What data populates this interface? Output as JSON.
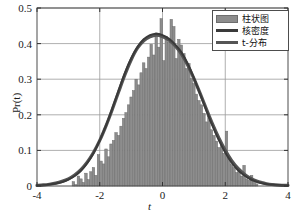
{
  "chart_data": {
    "type": "bar",
    "title": "",
    "xlabel": "t",
    "ylabel": "Pr(t)",
    "xlim": [
      -4,
      4
    ],
    "ylim": [
      0,
      0.5
    ],
    "grid": true,
    "xticks": [
      "-4",
      "-2",
      "0",
      "2",
      "4"
    ],
    "xtick_values": [
      -4,
      -2,
      0,
      2,
      4
    ],
    "yticks": [
      "0",
      "0.1",
      "0.2",
      "0.3",
      "0.4",
      "0.5"
    ],
    "ytick_values": [
      0,
      0.1,
      0.2,
      0.3,
      0.4,
      0.5
    ],
    "legend_position": "top-right",
    "legend": [
      {
        "label": "柱状图",
        "marker": "patch",
        "color": "#8d8d8d"
      },
      {
        "label": "核密度",
        "marker": "line",
        "color": "#3a3a3a"
      },
      {
        "label": "t-分布",
        "marker": "line",
        "color": "#555555"
      }
    ],
    "histogram": {
      "name": "柱状图",
      "color": "#8d8d8d",
      "edge_color": "#6e6e6e",
      "bin_width": 0.08,
      "bin_centers": [
        -2.84,
        -2.76,
        -2.68,
        -2.6,
        -2.52,
        -2.44,
        -2.36,
        -2.28,
        -2.2,
        -2.12,
        -2.04,
        -1.96,
        -1.88,
        -1.8,
        -1.72,
        -1.64,
        -1.56,
        -1.48,
        -1.4,
        -1.32,
        -1.24,
        -1.16,
        -1.08,
        -1.0,
        -0.92,
        -0.84,
        -0.76,
        -0.68,
        -0.6,
        -0.52,
        -0.44,
        -0.36,
        -0.28,
        -0.2,
        -0.12,
        -0.04,
        0.04,
        0.12,
        0.2,
        0.28,
        0.36,
        0.44,
        0.52,
        0.6,
        0.68,
        0.76,
        0.84,
        0.92,
        1.0,
        1.08,
        1.16,
        1.24,
        1.32,
        1.4,
        1.48,
        1.56,
        1.64,
        1.72,
        1.8,
        1.88,
        1.96,
        2.04,
        2.12,
        2.2,
        2.28,
        2.36,
        2.44,
        2.52,
        2.6,
        2.68,
        2.76,
        2.84,
        2.92,
        3.0
      ],
      "values": [
        0.012,
        0.004,
        0.028,
        0.02,
        0.01,
        0.036,
        0.018,
        0.04,
        0.052,
        0.03,
        0.088,
        0.07,
        0.062,
        0.104,
        0.082,
        0.118,
        0.128,
        0.15,
        0.142,
        0.168,
        0.19,
        0.206,
        0.228,
        0.25,
        0.268,
        0.3,
        0.284,
        0.318,
        0.346,
        0.33,
        0.362,
        0.398,
        0.368,
        0.43,
        0.39,
        0.47,
        0.352,
        0.42,
        0.404,
        0.468,
        0.448,
        0.358,
        0.412,
        0.396,
        0.372,
        0.33,
        0.344,
        0.302,
        0.288,
        0.258,
        0.24,
        0.228,
        0.204,
        0.18,
        0.196,
        0.158,
        0.142,
        0.126,
        0.108,
        0.118,
        0.092,
        0.154,
        0.078,
        0.06,
        0.052,
        0.038,
        0.044,
        0.028,
        0.058,
        0.02,
        0.016,
        0.03,
        0.01,
        0.006
      ]
    },
    "kde_curve": {
      "name": "核密度",
      "color": "#3a3a3a",
      "x": [
        -4.0,
        -3.8,
        -3.6,
        -3.4,
        -3.2,
        -3.0,
        -2.8,
        -2.6,
        -2.4,
        -2.2,
        -2.0,
        -1.8,
        -1.6,
        -1.4,
        -1.2,
        -1.0,
        -0.8,
        -0.6,
        -0.4,
        -0.2,
        0.0,
        0.2,
        0.4,
        0.6,
        0.8,
        1.0,
        1.2,
        1.4,
        1.6,
        1.8,
        2.0,
        2.2,
        2.4,
        2.6,
        2.8,
        3.0,
        3.2,
        3.4,
        3.6,
        3.8,
        4.0
      ],
      "y": [
        0.001,
        0.002,
        0.004,
        0.007,
        0.011,
        0.018,
        0.028,
        0.043,
        0.064,
        0.092,
        0.128,
        0.17,
        0.218,
        0.268,
        0.317,
        0.358,
        0.39,
        0.412,
        0.424,
        0.428,
        0.424,
        0.414,
        0.398,
        0.376,
        0.344,
        0.304,
        0.258,
        0.212,
        0.168,
        0.128,
        0.094,
        0.066,
        0.045,
        0.03,
        0.019,
        0.012,
        0.007,
        0.004,
        0.003,
        0.002,
        0.001
      ]
    },
    "t_distribution_curve": {
      "name": "t-分布",
      "color": "#555555",
      "x": [
        -4.0,
        -3.8,
        -3.6,
        -3.4,
        -3.2,
        -3.0,
        -2.8,
        -2.6,
        -2.4,
        -2.2,
        -2.0,
        -1.8,
        -1.6,
        -1.4,
        -1.2,
        -1.0,
        -0.8,
        -0.6,
        -0.4,
        -0.2,
        0.0,
        0.2,
        0.4,
        0.6,
        0.8,
        1.0,
        1.2,
        1.4,
        1.6,
        1.8,
        2.0,
        2.2,
        2.4,
        2.6,
        2.8,
        3.0,
        3.2,
        3.4,
        3.6,
        3.8,
        4.0
      ],
      "y": [
        0.002,
        0.003,
        0.005,
        0.008,
        0.013,
        0.02,
        0.031,
        0.046,
        0.067,
        0.094,
        0.128,
        0.169,
        0.215,
        0.264,
        0.312,
        0.354,
        0.387,
        0.408,
        0.419,
        0.424,
        0.42,
        0.41,
        0.394,
        0.371,
        0.34,
        0.302,
        0.26,
        0.216,
        0.173,
        0.134,
        0.1,
        0.072,
        0.05,
        0.034,
        0.022,
        0.014,
        0.009,
        0.005,
        0.003,
        0.002,
        0.002
      ]
    }
  }
}
